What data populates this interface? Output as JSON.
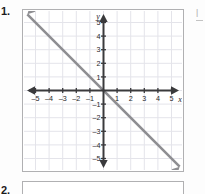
{
  "page": {
    "question_number": "1.",
    "next_question_number": "2.",
    "edge_fragment": "l"
  },
  "chart_data": {
    "type": "line",
    "title": "",
    "xlabel": "x",
    "ylabel": "y",
    "xlim": [
      -5.8,
      5.8
    ],
    "ylim": [
      -5.8,
      5.8
    ],
    "grid": true,
    "legend": null,
    "x_ticks": [
      -5,
      -4,
      -3,
      -2,
      -1,
      1,
      2,
      3,
      4,
      5
    ],
    "y_ticks": [
      5,
      4,
      3,
      2,
      1,
      -1,
      -2,
      -3,
      -4,
      -5
    ],
    "x_tick_labels": [
      "–5",
      "–4",
      "–3",
      "–2",
      "–1",
      "1",
      "2",
      "3",
      "4",
      "5"
    ],
    "y_tick_labels": [
      "5",
      "4",
      "3",
      "2",
      "1",
      "–1",
      "–2",
      "–3",
      "–4",
      "–5"
    ],
    "series": [
      {
        "name": "line",
        "equation": "y = -x",
        "slope": -1,
        "intercept": 0,
        "arrows": "both",
        "x": [
          -5.6,
          5.6
        ],
        "y": [
          5.6,
          -5.6
        ],
        "color": "#8e8e92"
      }
    ],
    "axis_color": "#3a3a3c",
    "grid_color": "#e4e4ea"
  },
  "colors": {
    "frame": "#b0b0b2",
    "line": "#8e8e92",
    "axis": "#3a3a3c",
    "grid": "#e4e4ea",
    "text": "#1b1b1b",
    "background": "#ffffff"
  }
}
